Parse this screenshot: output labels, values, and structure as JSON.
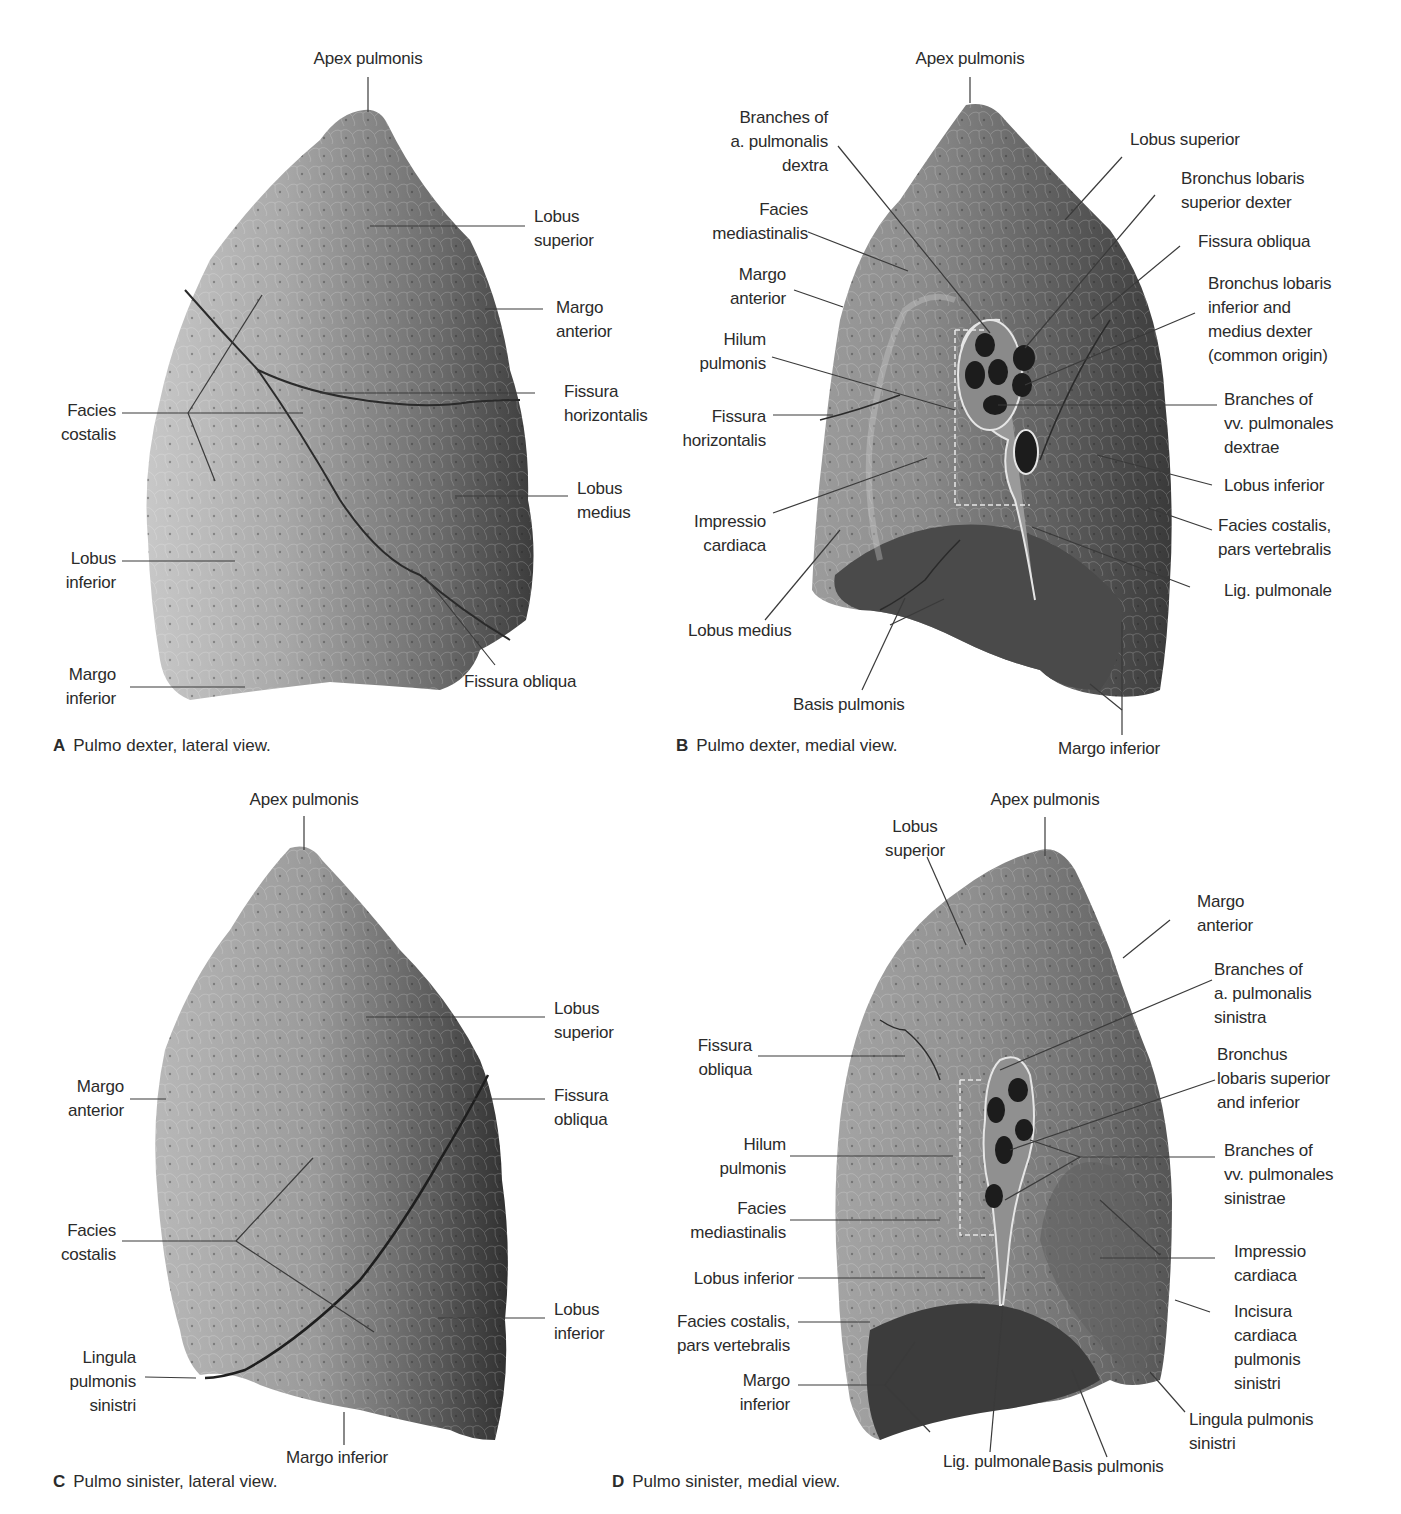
{
  "figure": {
    "panels": [
      {
        "id": "A",
        "caption_letter": "A",
        "caption": "Pulmo dexter, lateral view.",
        "labels": {
          "apex": "Apex pulmonis",
          "lobus_superior": "Lobus\nsuperior",
          "margo_anterior": "Margo\nanterior",
          "fissura_horizontalis": "Fissura\nhorizontalis",
          "facies_costalis": "Facies\ncostalis",
          "lobus_medius": "Lobus\nmedius",
          "lobus_inferior": "Lobus\ninferior",
          "margo_inferior": "Margo\ninferior",
          "fissura_obliqua": "Fissura obliqua"
        }
      },
      {
        "id": "B",
        "caption_letter": "B",
        "caption": "Pulmo dexter, medial view.",
        "labels": {
          "apex": "Apex pulmonis",
          "branches_a_pulmonalis": "Branches of\na. pulmonalis\ndextra",
          "lobus_superior": "Lobus superior",
          "bronchus_superior": "Bronchus lobaris\nsuperior dexter",
          "facies_mediastinalis": "Facies\nmediastinalis",
          "fissura_obliqua": "Fissura obliqua",
          "margo_anterior": "Margo\nanterior",
          "bronchus_inferior_medius": "Bronchus lobaris\ninferior and\nmedius dexter\n(common origin)",
          "hilum": "Hilum\npulmonis",
          "branches_vv_pulmonales": "Branches of\nvv. pulmonales\ndextrae",
          "fissura_horizontalis": "Fissura\nhorizontalis",
          "lobus_inferior": "Lobus inferior",
          "impressio_cardiaca": "Impressio\ncardiaca",
          "facies_costalis_vert": "Facies costalis,\npars vertebralis",
          "lig_pulmonale": "Lig. pulmonale",
          "lobus_medius": "Lobus medius",
          "basis": "Basis pulmonis",
          "margo_inferior": "Margo inferior"
        }
      },
      {
        "id": "C",
        "caption_letter": "C",
        "caption": "Pulmo sinister, lateral view.",
        "labels": {
          "apex": "Apex pulmonis",
          "lobus_superior": "Lobus\nsuperior",
          "margo_anterior": "Margo\nanterior",
          "fissura_obliqua": "Fissura\nobliqua",
          "facies_costalis": "Facies\ncostalis",
          "lobus_inferior": "Lobus\ninferior",
          "lingula": "Lingula\npulmonis\nsinistri",
          "margo_inferior": "Margo inferior"
        }
      },
      {
        "id": "D",
        "caption_letter": "D",
        "caption": "Pulmo sinister, medial view.",
        "labels": {
          "apex": "Apex pulmonis",
          "lobus_superior": "Lobus\nsuperior",
          "margo_anterior": "Margo\nanterior",
          "branches_a_pulmonalis": "Branches of\na. pulmonalis\nsinistra",
          "fissura_obliqua": "Fissura\nobliqua",
          "bronchus": "Bronchus\nlobaris superior\nand inferior",
          "hilum": "Hilum\npulmonis",
          "branches_vv_pulmonales": "Branches of\nvv. pulmonales\nsinistrae",
          "facies_mediastinalis": "Facies\nmediastinalis",
          "impressio_cardiaca": "Impressio\ncardiaca",
          "lobus_inferior": "Lobus inferior",
          "facies_costalis_vert": "Facies costalis,\npars vertebralis",
          "incisura_cardiaca": "Incisura\ncardiaca\npulmonis\nsinistri",
          "margo_inferior": "Margo\ninferior",
          "lingula": "Lingula pulmonis\nsinistri",
          "lig_pulmonale": "Lig. pulmonale",
          "basis": "Basis pulmonis"
        }
      }
    ],
    "colors": {
      "background": "#ffffff",
      "text": "#2b2b2b",
      "leader_line": "#3a3a3a",
      "lung_light": "#b8b8b8",
      "lung_mid": "#8a8a8a",
      "lung_dark": "#404040"
    }
  }
}
